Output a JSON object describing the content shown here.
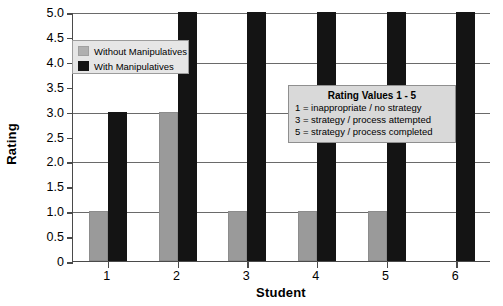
{
  "chart_data": {
    "type": "bar",
    "title": "",
    "xlabel": "Student",
    "ylabel": "Rating",
    "categories": [
      "1",
      "2",
      "3",
      "4",
      "5",
      "6"
    ],
    "series": [
      {
        "name": "Without Manipulatives",
        "color": "#9a9a9a",
        "values": [
          1,
          3,
          1,
          1,
          1,
          0
        ]
      },
      {
        "name": "With Manipulatives",
        "color": "#141414",
        "values": [
          3,
          5,
          5,
          5,
          5,
          5
        ]
      }
    ],
    "ylim": [
      0,
      5
    ],
    "ytick_labels": [
      "0",
      "0.5",
      "1.0",
      "1.5",
      "2.0",
      "2.5",
      "3.0",
      "3.5",
      "4.0",
      "4.5",
      "5.0"
    ],
    "ytick_values": [
      0,
      0.5,
      1.0,
      1.5,
      2.0,
      2.5,
      3.0,
      3.5,
      4.0,
      4.5,
      5.0
    ],
    "grid": true,
    "legend_position": "upper left"
  },
  "legend": {
    "entries": [
      {
        "label": "Without Manipulatives",
        "key": "without"
      },
      {
        "label": "With Manipulatives",
        "key": "with"
      }
    ]
  },
  "rating_note": {
    "title": "Rating Values 1 - 5",
    "lines": [
      "1 = inappropriate / no strategy",
      "3 = strategy / process attempted",
      "5 = strategy / process completed"
    ]
  }
}
